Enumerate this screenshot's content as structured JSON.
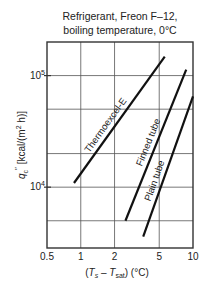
{
  "chart_data": {
    "type": "line",
    "title_lines": [
      "Refrigerant, Freon F–12,",
      "boiling temperature, 0°C"
    ],
    "xlabel": "(Ts – Tsat) (°C)",
    "ylabel": "q″c [kcal/(m² h)]",
    "xscale": "log",
    "yscale": "log",
    "xlim": [
      0.5,
      10
    ],
    "ylim": [
      2850,
      200000
    ],
    "x_ticks": [
      {
        "value": 0.5,
        "label": "0.5"
      },
      {
        "value": 1,
        "label": "1"
      },
      {
        "value": 2,
        "label": "2"
      },
      {
        "value": 5,
        "label": "5"
      },
      {
        "value": 10,
        "label": "10"
      }
    ],
    "y_ticks": [
      {
        "value": 10000,
        "label": "10",
        "exp": "4"
      },
      {
        "value": 100000,
        "label": "10",
        "exp": "5"
      }
    ],
    "y_gridlines": [
      5000,
      10000,
      20000,
      50000,
      100000,
      200000
    ],
    "x_gridlines": [
      1,
      2,
      5
    ],
    "grid": true,
    "legend": "inline labels along lines",
    "series": [
      {
        "name": "Thermoexcel-E",
        "x": [
          0.87,
          5.6
        ],
        "y": [
          10900,
          148000
        ]
      },
      {
        "name": "Finned tube",
        "x": [
          2.5,
          8.7
        ],
        "y": [
          5000,
          113000
        ]
      },
      {
        "name": "Plain tube",
        "x": [
          3.6,
          10
        ],
        "y": [
          3600,
          65000
        ]
      }
    ]
  }
}
